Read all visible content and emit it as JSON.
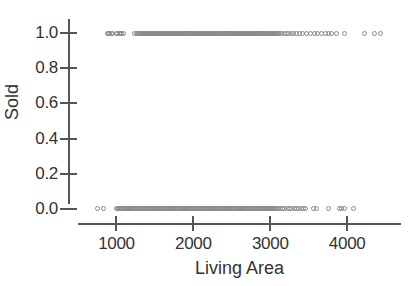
{
  "chart_data": {
    "type": "scatter",
    "title": "",
    "xlabel": "Living Area",
    "ylabel": "Sold",
    "grid": false,
    "legend": "none",
    "xlim": [
      500,
      4700
    ],
    "ylim": [
      -0.08,
      1.08
    ],
    "xticks": [
      1000,
      2000,
      3000,
      4000
    ],
    "xticklabels": [
      "1000",
      "2000",
      "3000",
      "4000"
    ],
    "yticks": [
      0.0,
      0.2,
      0.4,
      0.6,
      0.8,
      1.0
    ],
    "yticklabels": [
      "0.0",
      "0.2",
      "0.4",
      "0.6",
      "0.8",
      "1.0"
    ],
    "marker": "open-circle",
    "marker_color": "#8a8a8a",
    "series": [
      {
        "name": "Sold = 1",
        "y_value": 1.0,
        "x": [
          880,
          900,
          915,
          930,
          948,
          1000,
          1020,
          1038,
          1055,
          1072,
          1090,
          1240,
          1255,
          1268,
          1282,
          1296,
          1310,
          1322,
          1336,
          1350,
          1364,
          1378,
          1392,
          1406,
          1418,
          1430,
          1444,
          1458,
          1470,
          1484,
          1496,
          1510,
          1522,
          1536,
          1548,
          1560,
          1574,
          1586,
          1600,
          1612,
          1626,
          1638,
          1650,
          1664,
          1676,
          1690,
          1702,
          1714,
          1728,
          1740,
          1752,
          1766,
          1778,
          1790,
          1804,
          1816,
          1828,
          1842,
          1854,
          1866,
          1880,
          1892,
          1904,
          1918,
          1930,
          1942,
          1956,
          1968,
          1980,
          1994,
          2006,
          2018,
          2032,
          2044,
          2056,
          2070,
          2082,
          2094,
          2108,
          2120,
          2132,
          2146,
          2158,
          2170,
          2184,
          2196,
          2208,
          2222,
          2234,
          2246,
          2260,
          2272,
          2284,
          2298,
          2310,
          2322,
          2336,
          2348,
          2360,
          2374,
          2386,
          2398,
          2412,
          2424,
          2436,
          2450,
          2462,
          2474,
          2488,
          2500,
          2512,
          2526,
          2538,
          2550,
          2564,
          2576,
          2588,
          2602,
          2614,
          2626,
          2640,
          2652,
          2664,
          2678,
          2690,
          2702,
          2716,
          2728,
          2740,
          2754,
          2766,
          2778,
          2792,
          2804,
          2816,
          2830,
          2842,
          2854,
          2868,
          2880,
          2892,
          2906,
          2918,
          2930,
          2944,
          2956,
          2968,
          2982,
          2994,
          3006,
          3020,
          3032,
          3044,
          3058,
          3070,
          3082,
          3096,
          3108,
          3120,
          3150,
          3180,
          3210,
          3240,
          3270,
          3300,
          3340,
          3380,
          3420,
          3470,
          3520,
          3580,
          3620,
          3660,
          3720,
          3760,
          3800,
          3860,
          3960,
          4220,
          4360,
          4430
        ]
      },
      {
        "name": "Sold = 0",
        "y_value": 0.0,
        "x": [
          760,
          838,
          1000,
          1016,
          1030,
          1044,
          1058,
          1072,
          1086,
          1100,
          1114,
          1128,
          1142,
          1156,
          1170,
          1184,
          1198,
          1212,
          1226,
          1240,
          1254,
          1268,
          1282,
          1296,
          1310,
          1324,
          1338,
          1352,
          1366,
          1380,
          1394,
          1408,
          1422,
          1436,
          1450,
          1464,
          1478,
          1492,
          1506,
          1520,
          1534,
          1548,
          1562,
          1576,
          1590,
          1604,
          1618,
          1632,
          1646,
          1660,
          1674,
          1688,
          1702,
          1716,
          1730,
          1744,
          1758,
          1772,
          1786,
          1800,
          1814,
          1828,
          1842,
          1856,
          1870,
          1884,
          1898,
          1912,
          1926,
          1940,
          1954,
          1968,
          1982,
          1996,
          2010,
          2024,
          2038,
          2052,
          2066,
          2080,
          2094,
          2108,
          2122,
          2136,
          2150,
          2164,
          2178,
          2192,
          2206,
          2220,
          2234,
          2248,
          2262,
          2276,
          2290,
          2304,
          2318,
          2332,
          2346,
          2360,
          2374,
          2388,
          2402,
          2416,
          2430,
          2444,
          2458,
          2472,
          2486,
          2500,
          2514,
          2528,
          2542,
          2556,
          2570,
          2584,
          2598,
          2612,
          2626,
          2640,
          2654,
          2668,
          2682,
          2696,
          2710,
          2724,
          2738,
          2752,
          2766,
          2780,
          2794,
          2808,
          2822,
          2836,
          2850,
          2864,
          2878,
          2892,
          2906,
          2920,
          2934,
          2948,
          2962,
          2976,
          2990,
          3004,
          3018,
          3032,
          3046,
          3060,
          3074,
          3088,
          3102,
          3130,
          3160,
          3190,
          3220,
          3250,
          3280,
          3310,
          3340,
          3370,
          3400,
          3430,
          3460,
          3560,
          3600,
          3760,
          3900,
          3930,
          3960,
          4080
        ]
      }
    ]
  },
  "axes": {
    "ylabel_text": "Sold",
    "xlabel_text": "Living Area"
  }
}
